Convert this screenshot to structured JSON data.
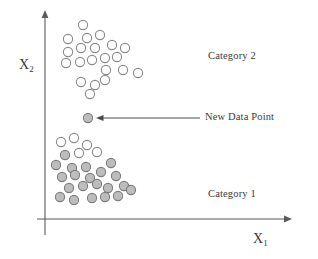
{
  "figure": {
    "type": "scatter",
    "background_color": "#ffffff"
  },
  "axes": {
    "x_label": "X",
    "x_label_sub": "1",
    "y_label": "X",
    "y_label_sub": "2",
    "axis_color": "#5a5a5a",
    "origin": {
      "x": 45,
      "y": 219
    },
    "x_axis": {
      "x_start": 37,
      "x_end": 292,
      "y": 219,
      "arrow": "right"
    },
    "y_axis": {
      "x": 45,
      "y_start": 235,
      "y_end": 10,
      "arrow": "up"
    }
  },
  "annotations": {
    "category_2": "Category 2",
    "category_1": "Category 1",
    "new_data_point": "New Data Point",
    "arrow": {
      "from_x": 200,
      "from_y": 118,
      "to_x": 96,
      "to_y": 118,
      "color": "#4a4a4a",
      "direction": "left"
    }
  },
  "style": {
    "open_circle_fill": "#ffffff",
    "open_circle_stroke": "#8a8a8a",
    "filled_circle_fill": "#bdbdbd",
    "filled_circle_stroke": "#7d7d7d",
    "circle_radius": 4.6,
    "circle_stroke_width": 1.1
  },
  "chart_data": {
    "type": "scatter",
    "title": "",
    "xlabel": "X1",
    "ylabel": "X2",
    "grid": false,
    "legend": false,
    "xlim": [
      45,
      292
    ],
    "ylim": [
      219,
      10
    ],
    "series": [
      {
        "name": "Category 2",
        "marker": "open-circle",
        "fill": "#ffffff",
        "stroke": "#8a8a8a",
        "count": 21,
        "points": [
          [
            83,
            25
          ],
          [
            68,
            39
          ],
          [
            87,
            38
          ],
          [
            100,
            35
          ],
          [
            68,
            52
          ],
          [
            81,
            48
          ],
          [
            95,
            48
          ],
          [
            112,
            45
          ],
          [
            125,
            48
          ],
          [
            66,
            63
          ],
          [
            80,
            62
          ],
          [
            92,
            60
          ],
          [
            105,
            58
          ],
          [
            117,
            57
          ],
          [
            106,
            70
          ],
          [
            123,
            70
          ],
          [
            138,
            73
          ],
          [
            81,
            82
          ],
          [
            95,
            85
          ],
          [
            105,
            80
          ],
          [
            90,
            94
          ]
        ]
      },
      {
        "name": "New Data Point",
        "marker": "filled-circle",
        "fill": "#bdbdbd",
        "stroke": "#7d7d7d",
        "count": 1,
        "points": [
          [
            88,
            118
          ]
        ]
      },
      {
        "name": "Category 1",
        "marker": "mixed-circle",
        "fill": "#bdbdbd",
        "stroke": "#7d7d7d",
        "count": 26,
        "points": [
          [
            61,
            142,
            "open"
          ],
          [
            74,
            138,
            "open"
          ],
          [
            87,
            145,
            "open"
          ],
          [
            65,
            155,
            "filled"
          ],
          [
            79,
            153,
            "open"
          ],
          [
            97,
            152,
            "open"
          ],
          [
            56,
            165,
            "filled"
          ],
          [
            72,
            168,
            "filled"
          ],
          [
            86,
            167,
            "filled"
          ],
          [
            111,
            163,
            "filled"
          ],
          [
            62,
            177,
            "filled"
          ],
          [
            75,
            175,
            "filled"
          ],
          [
            90,
            178,
            "filled"
          ],
          [
            101,
            172,
            "filled"
          ],
          [
            116,
            176,
            "filled"
          ],
          [
            69,
            188,
            "filled"
          ],
          [
            83,
            186,
            "filled"
          ],
          [
            97,
            184,
            "filled"
          ],
          [
            108,
            188,
            "filled"
          ],
          [
            124,
            186,
            "filled"
          ],
          [
            60,
            197,
            "filled"
          ],
          [
            74,
            200,
            "filled"
          ],
          [
            92,
            198,
            "filled"
          ],
          [
            105,
            197,
            "filled"
          ],
          [
            118,
            196,
            "filled"
          ],
          [
            131,
            190,
            "filled"
          ]
        ]
      }
    ]
  }
}
